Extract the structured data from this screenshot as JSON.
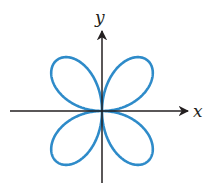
{
  "figure": {
    "x_label": "x",
    "y_label": "y",
    "curve_color": "#2e8bc9",
    "axis_color": "#231f20",
    "center": [
      102,
      111
    ],
    "scale_x": 66,
    "scale_y": 70,
    "petals": 4,
    "equation_form": "r = sin(2θ)"
  }
}
